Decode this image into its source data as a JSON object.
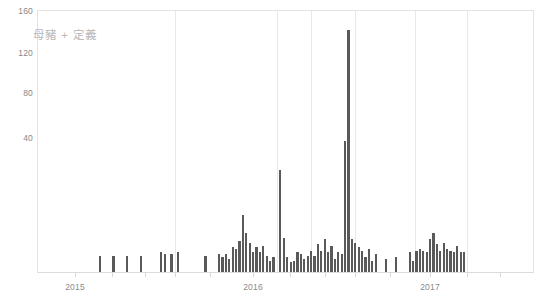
{
  "chart_data": {
    "type": "bar",
    "title": "母豬 + 定義",
    "xlabel": "",
    "ylabel": "",
    "ylim": [
      0,
      160
    ],
    "yticks": [
      40,
      80,
      120,
      160
    ],
    "xticks": [
      "2015",
      "2016",
      "2017"
    ],
    "grid": "vertical-only",
    "legend": "none",
    "bar_color": "#595959",
    "series_name": "母豬 + 定義",
    "note": "Weekly search-interest style bars; x spans roughly 2015 through late 2017.",
    "x": [
      0,
      1,
      2,
      3,
      4,
      5,
      6,
      7,
      8,
      9,
      10,
      11,
      12,
      13,
      14,
      15,
      16,
      17,
      18,
      19,
      20,
      21,
      22,
      23,
      24,
      25,
      26,
      27,
      28,
      29,
      30,
      31,
      32,
      33,
      34,
      35,
      36,
      37,
      38,
      39,
      40,
      41,
      42,
      43,
      44,
      45,
      46,
      47,
      48,
      49,
      50,
      51,
      52,
      53,
      54,
      55,
      56,
      57,
      58,
      59,
      60,
      61,
      62,
      63,
      64,
      65,
      66,
      67,
      68,
      69,
      70,
      71,
      72,
      73,
      74,
      75,
      76,
      77,
      78,
      79,
      80,
      81,
      82,
      83,
      84,
      85,
      86,
      87,
      88,
      89,
      90,
      91,
      92,
      93,
      94,
      95,
      96,
      97,
      98,
      99,
      100,
      101,
      102,
      103,
      104,
      105,
      106,
      107,
      108,
      109,
      110,
      111,
      112,
      113,
      114,
      115,
      116,
      117,
      118,
      119,
      120,
      121,
      122,
      123,
      124,
      125,
      126,
      127,
      128,
      129,
      130,
      131,
      132,
      133,
      134,
      135,
      136,
      137,
      138,
      139,
      140,
      141,
      142,
      143,
      144,
      145
    ],
    "values": [
      0,
      0,
      0,
      0,
      0,
      0,
      0,
      0,
      0,
      0,
      0,
      0,
      0,
      0,
      0,
      0,
      0,
      0,
      10,
      0,
      0,
      0,
      10,
      0,
      0,
      0,
      10,
      0,
      0,
      0,
      10,
      0,
      0,
      0,
      0,
      0,
      12,
      11,
      0,
      11,
      0,
      12,
      0,
      0,
      0,
      0,
      0,
      0,
      0,
      10,
      0,
      0,
      0,
      11,
      9,
      11,
      8,
      15,
      14,
      19,
      35,
      24,
      18,
      12,
      15,
      12,
      16,
      10,
      7,
      9,
      0,
      62,
      21,
      9,
      6,
      7,
      12,
      11,
      8,
      10,
      13,
      10,
      17,
      13,
      20,
      12,
      16,
      8,
      12,
      11,
      80,
      148,
      20,
      18,
      15,
      13,
      9,
      14,
      7,
      11,
      0,
      0,
      8,
      0,
      0,
      9,
      0,
      0,
      0,
      12,
      7,
      13,
      14,
      13,
      12,
      20,
      24,
      17,
      13,
      18,
      14,
      13,
      12,
      16,
      12,
      12,
      0,
      0,
      0,
      0,
      0,
      0,
      0,
      0,
      0,
      0,
      0,
      0,
      0,
      0,
      0,
      0,
      0,
      0,
      0,
      0
    ]
  },
  "axes": {
    "y_ticks": [
      {
        "label": "160",
        "value": 160
      },
      {
        "label": "120",
        "value": 120
      },
      {
        "label": "80",
        "value": 80
      },
      {
        "label": "40",
        "value": 40
      }
    ],
    "x_ticks": [
      {
        "label": "2015",
        "pos_px": 75
      },
      {
        "label": "2016",
        "pos_px": 253
      },
      {
        "label": "2017",
        "pos_px": 430
      }
    ],
    "gridline_px": [
      175,
      277,
      311,
      355,
      415,
      467
    ]
  },
  "title": {
    "text": "母豬 + 定義"
  }
}
